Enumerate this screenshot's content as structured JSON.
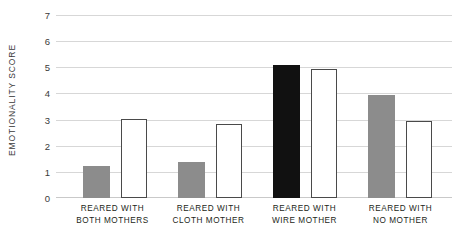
{
  "chart_data": {
    "type": "bar",
    "title": "",
    "subtitle": "",
    "xlabel": "",
    "ylabel": "EMOTIONALITY SCORE",
    "ylim": [
      0,
      7
    ],
    "ytick_values": [
      0,
      1,
      2,
      3,
      4,
      5,
      6,
      7
    ],
    "ytick_labels": [
      "0",
      "1",
      "2",
      "3",
      "4",
      "5",
      "6",
      "7"
    ],
    "grid": true,
    "legend": "none",
    "categories": [
      "REARED WITH BOTH MOTHERS",
      "REARED WITH CLOTH MOTHER",
      "REARED WITH WIRE MOTHER",
      "REARED WITH NO MOTHER"
    ],
    "category_lines": [
      [
        "REARED WITH",
        "BOTH MOTHERS"
      ],
      [
        "REARED WITH",
        "CLOTH MOTHER"
      ],
      [
        "REARED WITH",
        "WIRE MOTHER"
      ],
      [
        "REARED WITH",
        "NO MOTHER"
      ]
    ],
    "series": [
      {
        "name": "filled-bar",
        "values": [
          1.25,
          1.4,
          5.1,
          3.95
        ],
        "fills": [
          "#8c8c8c",
          "#8c8c8c",
          "#111111",
          "#8c8c8c"
        ],
        "style": "filled"
      },
      {
        "name": "open-bar",
        "values": [
          3.05,
          2.85,
          4.95,
          2.95
        ],
        "fills": [
          "#ffffff",
          "#ffffff",
          "#ffffff",
          "#ffffff"
        ],
        "style": "outlined"
      }
    ]
  },
  "colors": {
    "gray_bar": "#8c8c8c",
    "black_bar": "#111111",
    "white_bar": "#ffffff",
    "bar_outline": "#4a4a4a",
    "gridline": "#d7d7d7",
    "text": "#231f20",
    "background": "#ffffff"
  }
}
